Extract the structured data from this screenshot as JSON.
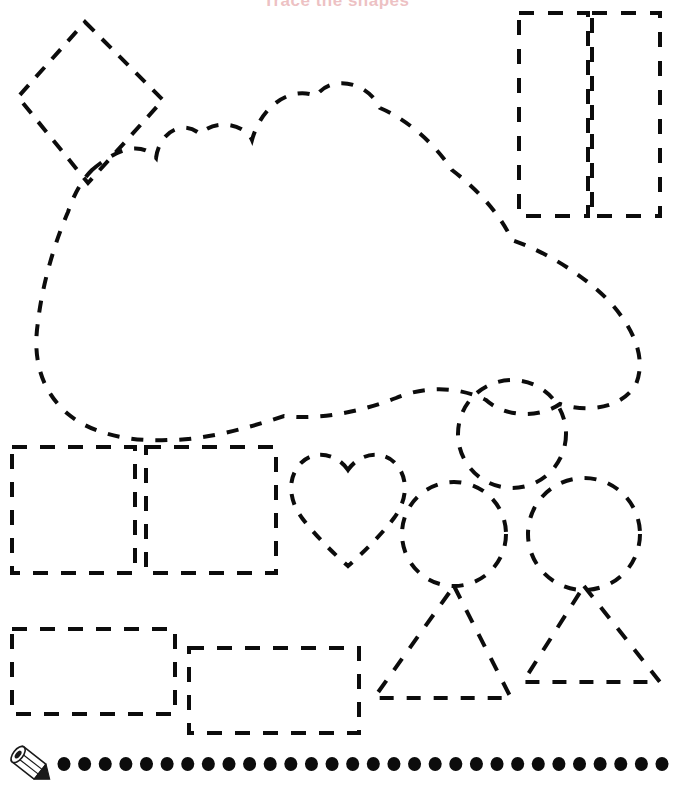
{
  "page": {
    "width": 673,
    "height": 789,
    "background_color": "#ffffff",
    "kind": "printable-tracing-worksheet",
    "title": "Trace the shapes",
    "title_color": "#c0232b",
    "ink_color": "#0c0c0c"
  },
  "stroke": {
    "width": 4,
    "dash_pattern": "12 10",
    "dash_pattern_curve": "11 11",
    "linecap": "butt"
  },
  "shapes": [
    {
      "name": "diamond-top-left",
      "type": "diamond",
      "label": "diamond",
      "points": "85,22 163,100 88,183 18,97",
      "dash": "13 11"
    },
    {
      "name": "rectangle-top-right-left",
      "type": "rectangle",
      "label": "tall rectangle",
      "x": 519,
      "y": 13,
      "width": 69,
      "height": 203,
      "dash": "15 14"
    },
    {
      "name": "rectangle-top-right-right",
      "type": "rectangle",
      "label": "tall rectangle",
      "x": 592,
      "y": 13,
      "width": 68,
      "height": 203,
      "dash": "15 14"
    },
    {
      "name": "cloud-large",
      "type": "cloud",
      "label": "cloud",
      "path": "M 92,170 C 120,146 142,142 156,158 C 160,130 184,120 200,134 C 216,118 245,124 252,140 C 262,104 292,86 316,96 C 332,74 368,82 380,108 C 404,118 432,140 452,170 C 478,190 500,214 512,240 C 546,252 582,274 608,300 C 636,330 646,360 636,384 C 624,406 592,414 560,404 C 540,418 506,418 486,400 C 458,386 424,386 396,398 C 360,412 320,420 284,416 C 248,428 206,440 168,440 C 130,442 92,434 68,414 C 42,392 32,360 38,322 C 42,286 54,244 68,212 C 74,194 82,180 92,170 Z",
      "dash": "12 12"
    },
    {
      "name": "square-middle-left-1",
      "type": "rectangle",
      "label": "square",
      "x": 12,
      "y": 447,
      "width": 123,
      "height": 126,
      "dash": "15 13"
    },
    {
      "name": "square-middle-left-2",
      "type": "rectangle",
      "label": "square",
      "x": 146,
      "y": 447,
      "width": 130,
      "height": 126,
      "dash": "15 13"
    },
    {
      "name": "heart-middle",
      "type": "heart",
      "label": "heart",
      "path": "M 348,470 C 336,452 312,450 300,464 C 286,480 290,502 302,518 C 314,534 334,554 348,566 C 362,554 382,534 394,518 C 406,502 410,480 396,464 C 384,450 360,452 348,470 Z",
      "dash": "11 11"
    },
    {
      "name": "circle-top",
      "type": "circle",
      "label": "circle",
      "cx": 512,
      "cy": 434,
      "r": 54,
      "dash": "12 12"
    },
    {
      "name": "circle-bottom-left",
      "type": "circle",
      "label": "circle",
      "cx": 454,
      "cy": 534,
      "r": 52,
      "dash": "12 12"
    },
    {
      "name": "circle-bottom-right",
      "type": "circle",
      "label": "circle",
      "cx": 584,
      "cy": 534,
      "r": 56,
      "dash": "12 12"
    },
    {
      "name": "rectangle-bottom-left-1",
      "type": "rectangle",
      "label": "rectangle",
      "x": 12,
      "y": 629,
      "width": 163,
      "height": 85,
      "dash": "15 13"
    },
    {
      "name": "rectangle-bottom-left-2",
      "type": "rectangle",
      "label": "rectangle",
      "x": 189,
      "y": 648,
      "width": 170,
      "height": 85,
      "dash": "15 13"
    },
    {
      "name": "triangle-bottom-left",
      "type": "triangle",
      "label": "triangle",
      "points": "454,586 511,698 374,698",
      "dash": "14 13"
    },
    {
      "name": "triangle-bottom-right",
      "type": "triangle",
      "label": "triangle",
      "points": "584,586 660,682 523,682",
      "dash": "14 13"
    }
  ],
  "dot_row": {
    "name": "tracing-dot-row",
    "count": 30,
    "start_x": 64,
    "end_x": 662,
    "y": 764,
    "radius": 6.5,
    "color": "#0c0c0c"
  },
  "pencil": {
    "name": "pencil-icon",
    "x": 8,
    "y": 748,
    "width": 48,
    "height": 36,
    "label": "pencil"
  }
}
